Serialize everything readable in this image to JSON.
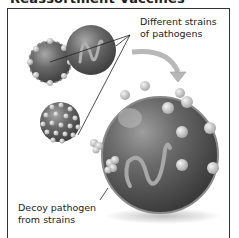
{
  "title": "Reassortment Vaccines",
  "labels": {
    "strains": [
      "Different strains",
      "of pathogens"
    ],
    "decoy": [
      "Decoy pathogen",
      "from strains"
    ]
  },
  "colors": {
    "sphere_dark": "#555555",
    "sphere_light": "#9a9a9a",
    "knob": "#d8d8d8",
    "arrow": "#b8b8b8",
    "border": "#333333"
  },
  "figures": [
    {
      "name": "strain-sphere-knobbed",
      "cx": 50,
      "cy": 62,
      "r": 21
    },
    {
      "name": "strain-sphere-rna",
      "cx": 91,
      "cy": 50,
      "r": 25
    },
    {
      "name": "strain-sphere-dotted",
      "cx": 60,
      "cy": 122,
      "r": 20
    },
    {
      "name": "decoy-pathogen-sphere",
      "cx": 160,
      "cy": 155,
      "r": 58
    }
  ]
}
